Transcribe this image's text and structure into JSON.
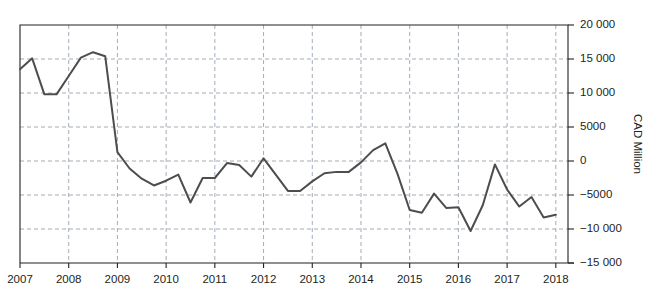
{
  "top_partial_text": "",
  "chart_data": {
    "type": "line",
    "title": "",
    "subtitle": "",
    "xlabel": "",
    "ylabel": "CAD Million",
    "ylim": [
      -15000,
      20000
    ],
    "xlim": [
      2007,
      2018.25
    ],
    "y_ticks": [
      20000,
      15000,
      10000,
      5000,
      0,
      -5000,
      -10000,
      -15000
    ],
    "y_tick_labels": [
      "20 000",
      "15 000",
      "10 000",
      "5000",
      "0",
      "−5000",
      "−10 000",
      "−15 000"
    ],
    "x_ticks": [
      2007,
      2008,
      2009,
      2010,
      2011,
      2012,
      2013,
      2014,
      2015,
      2016,
      2017,
      2018
    ],
    "x_tick_labels": [
      "2007",
      "2008",
      "2009",
      "2010",
      "2011",
      "2012",
      "2013",
      "2014",
      "2015",
      "2016",
      "2017",
      "2018"
    ],
    "grid": "dashed-both",
    "legend": "none",
    "line_color": "#4d4d4d",
    "axis_color": "#231f20",
    "grid_color": "#9aa3b0",
    "series": [
      {
        "name": "Current account balance",
        "x": [
          2007.0,
          2007.25,
          2007.5,
          2007.75,
          2008.0,
          2008.25,
          2008.5,
          2008.75,
          2009.0,
          2009.25,
          2009.5,
          2009.75,
          2010.0,
          2010.25,
          2010.5,
          2010.75,
          2011.0,
          2011.25,
          2011.5,
          2011.75,
          2012.0,
          2012.25,
          2012.5,
          2012.75,
          2013.0,
          2013.25,
          2013.5,
          2013.75,
          2014.0,
          2014.25,
          2014.5,
          2014.75,
          2015.0,
          2015.25,
          2015.5,
          2015.75,
          2016.0,
          2016.25,
          2016.5,
          2016.75,
          2017.0,
          2017.25,
          2017.5,
          2017.75,
          2018.0
        ],
        "values": [
          13500,
          15100,
          9800,
          9800,
          12500,
          15200,
          16000,
          15400,
          1300,
          -1100,
          -2600,
          -3600,
          -2900,
          -2000,
          -6100,
          -2500,
          -2500,
          -300,
          -600,
          -2300,
          400,
          -2000,
          -4400,
          -4400,
          -3000,
          -1800,
          -1600,
          -1600,
          -200,
          1600,
          2600,
          -1900,
          -7200,
          -7600,
          -4800,
          -6900,
          -6800,
          -10300,
          -6500,
          -500,
          -4200,
          -6700,
          -5300,
          -8300,
          -7900
        ]
      }
    ]
  }
}
